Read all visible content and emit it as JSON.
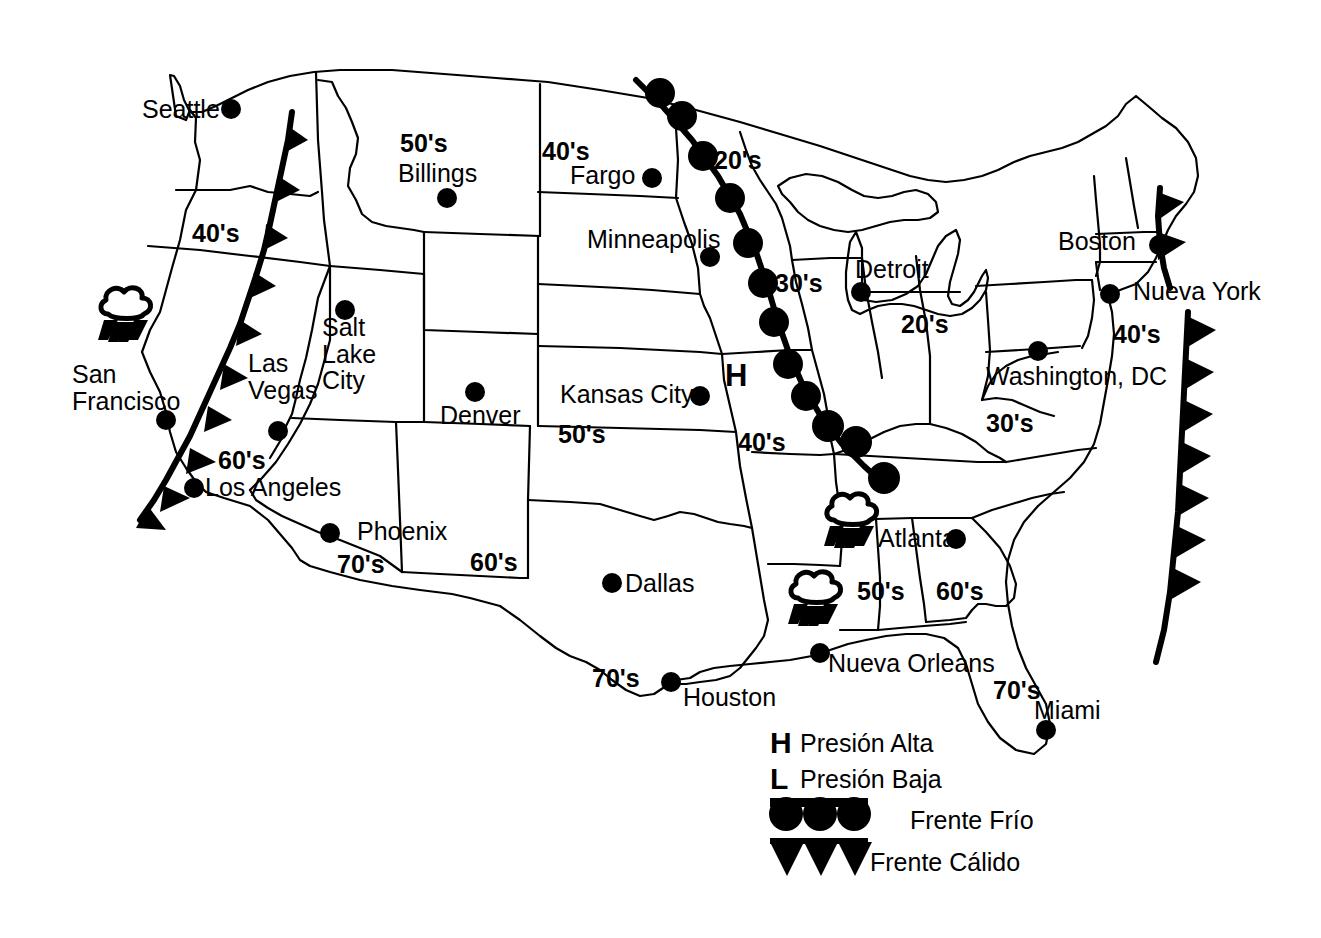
{
  "map": {
    "title": "Mapa del tiempo de los Estados Unidos",
    "background_color": "#ffffff",
    "ink_color": "#000000"
  },
  "cities": [
    {
      "name": "Seattle",
      "label_x": 142,
      "label_y": 96,
      "dot_x": 231,
      "dot_y": 109,
      "align": "left"
    },
    {
      "name": "Billings",
      "label_x": 398,
      "label_y": 160,
      "dot_x": 447,
      "dot_y": 198,
      "align": "left"
    },
    {
      "name": "Fargo",
      "label_x": 570,
      "label_y": 162,
      "dot_x": 652,
      "dot_y": 178,
      "align": "left"
    },
    {
      "name": "Minneapolis",
      "label_x": 587,
      "label_y": 226,
      "dot_x": 710,
      "dot_y": 257,
      "align": "left"
    },
    {
      "name": "Detroit",
      "label_x": 855,
      "label_y": 256,
      "dot_x": 861,
      "dot_y": 292,
      "align": "left"
    },
    {
      "name": "Boston",
      "label_x": 1058,
      "label_y": 228,
      "dot_x": 1159,
      "dot_y": 245,
      "align": "left"
    },
    {
      "name": "Nueva York",
      "label_x": 1133,
      "label_y": 278,
      "dot_x": 1110,
      "dot_y": 294,
      "align": "left"
    },
    {
      "name": "Washington, DC",
      "label_x": 986,
      "label_y": 363,
      "dot_x": 1038,
      "dot_y": 351,
      "align": "left"
    },
    {
      "name": "San\nFrancisco",
      "label_x": 72,
      "label_y": 361,
      "dot_x": 166,
      "dot_y": 420,
      "align": "left"
    },
    {
      "name": "Las\nVegas",
      "label_x": 248,
      "label_y": 350,
      "dot_x": 278,
      "dot_y": 431,
      "align": "left"
    },
    {
      "name": "Salt\nLake\nCity",
      "label_x": 322,
      "label_y": 314,
      "dot_x": 345,
      "dot_y": 310,
      "align": "left"
    },
    {
      "name": "Denver",
      "label_x": 440,
      "label_y": 402,
      "dot_x": 475,
      "dot_y": 392,
      "align": "left"
    },
    {
      "name": "Kansas City",
      "label_x": 560,
      "label_y": 381,
      "dot_x": 700,
      "dot_y": 396,
      "align": "left"
    },
    {
      "name": "Los Angeles",
      "label_x": 205,
      "label_y": 474,
      "dot_x": 194,
      "dot_y": 488,
      "align": "left"
    },
    {
      "name": "Phoenix",
      "label_x": 357,
      "label_y": 518,
      "dot_x": 330,
      "dot_y": 533,
      "align": "left"
    },
    {
      "name": "Dallas",
      "label_x": 625,
      "label_y": 570,
      "dot_x": 612,
      "dot_y": 583,
      "align": "left"
    },
    {
      "name": "Atlanta",
      "label_x": 878,
      "label_y": 525,
      "dot_x": 956,
      "dot_y": 539,
      "align": "left"
    },
    {
      "name": "Nueva Orleans",
      "label_x": 828,
      "label_y": 650,
      "dot_x": 820,
      "dot_y": 653,
      "align": "left"
    },
    {
      "name": "Houston",
      "label_x": 683,
      "label_y": 684,
      "dot_x": 671,
      "dot_y": 682,
      "align": "left"
    },
    {
      "name": "Miami",
      "label_x": 1034,
      "label_y": 697,
      "dot_x": 1046,
      "dot_y": 730,
      "align": "left"
    }
  ],
  "temperatures": [
    {
      "value": "50's",
      "x": 400,
      "y": 130
    },
    {
      "value": "40's",
      "x": 542,
      "y": 138
    },
    {
      "value": "20's",
      "x": 714,
      "y": 147
    },
    {
      "value": "40's",
      "x": 192,
      "y": 220
    },
    {
      "value": "30's",
      "x": 775,
      "y": 270
    },
    {
      "value": "20's",
      "x": 901,
      "y": 311
    },
    {
      "value": "40's",
      "x": 1113,
      "y": 321
    },
    {
      "value": "30's",
      "x": 986,
      "y": 410
    },
    {
      "value": "50's",
      "x": 558,
      "y": 421
    },
    {
      "value": "40's",
      "x": 738,
      "y": 429
    },
    {
      "value": "60's",
      "x": 218,
      "y": 447
    },
    {
      "value": "70's",
      "x": 337,
      "y": 551
    },
    {
      "value": "60's",
      "x": 470,
      "y": 549
    },
    {
      "value": "50's",
      "x": 857,
      "y": 578
    },
    {
      "value": "60's",
      "x": 936,
      "y": 578
    },
    {
      "value": "70's",
      "x": 592,
      "y": 665
    },
    {
      "value": "70's",
      "x": 993,
      "y": 677
    }
  ],
  "pressure_markers": [
    {
      "symbol": "H",
      "meaning": "Presión Alta",
      "x": 725,
      "y": 360
    }
  ],
  "fronts": [
    {
      "type": "cold",
      "name": "frente-frio-central",
      "label": "Frente Frío",
      "description": "Cold front from Minnesota south-east through Missouri to Georgia"
    },
    {
      "type": "warm",
      "name": "frente-calido-oeste",
      "label": "Frente Cálido",
      "description": "Warm front along the West Coast from Washington to southern California"
    },
    {
      "type": "warm",
      "name": "frente-calido-este",
      "label": "Frente Cálido",
      "description": "Warm front offshore along the Atlantic coast"
    },
    {
      "type": "warm",
      "name": "frente-calido-nueva-inglaterra",
      "label": "Frente Cálido",
      "description": "Short warm front segment near Boston"
    }
  ],
  "storms": [
    {
      "name": "tormenta-san-francisco",
      "x": 122,
      "y": 317
    },
    {
      "name": "tormenta-atlanta",
      "x": 848,
      "y": 523
    },
    {
      "name": "tormenta-nueva-orleans",
      "x": 812,
      "y": 600
    }
  ],
  "legend": {
    "items": [
      {
        "glyph": "H",
        "symbol_type": "high-pressure",
        "label": "Presión Alta"
      },
      {
        "glyph": "L",
        "symbol_type": "low-pressure",
        "label": "Presión Baja"
      },
      {
        "glyph": "",
        "symbol_type": "cold-front",
        "label": "Frente Frío"
      },
      {
        "glyph": "",
        "symbol_type": "warm-front",
        "label": "Frente Cálido"
      }
    ]
  }
}
